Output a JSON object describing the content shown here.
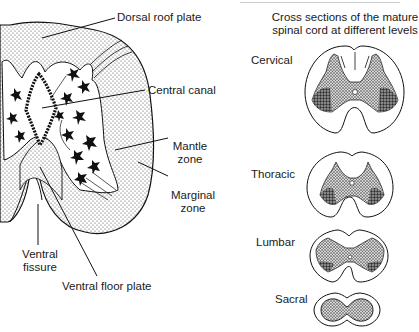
{
  "figure": {
    "left_panel": {
      "subject": "Developing spinal cord cross section (half)",
      "labels": {
        "dorsal_roof_plate": "Dorsal roof plate",
        "central_canal": "Central canal",
        "mantle_zone_line1": "Mantle",
        "mantle_zone_line2": "zone",
        "marginal_zone_line1": "Marginal",
        "marginal_zone_line2": "zone",
        "ventral_fissure_line1": "Ventral",
        "ventral_fissure_line2": "fissure",
        "ventral_floor_plate": "Ventral floor plate"
      }
    },
    "right_panel": {
      "title_line1": "Cross sections of the mature",
      "title_line2": "spinal cord at different levels",
      "levels": [
        {
          "label": "Cervical"
        },
        {
          "label": "Thoracic"
        },
        {
          "label": "Lumbar"
        },
        {
          "label": "Sacral"
        }
      ]
    },
    "colors": {
      "ink": "#111111",
      "background": "#ffffff",
      "stipple": "#555555"
    }
  }
}
